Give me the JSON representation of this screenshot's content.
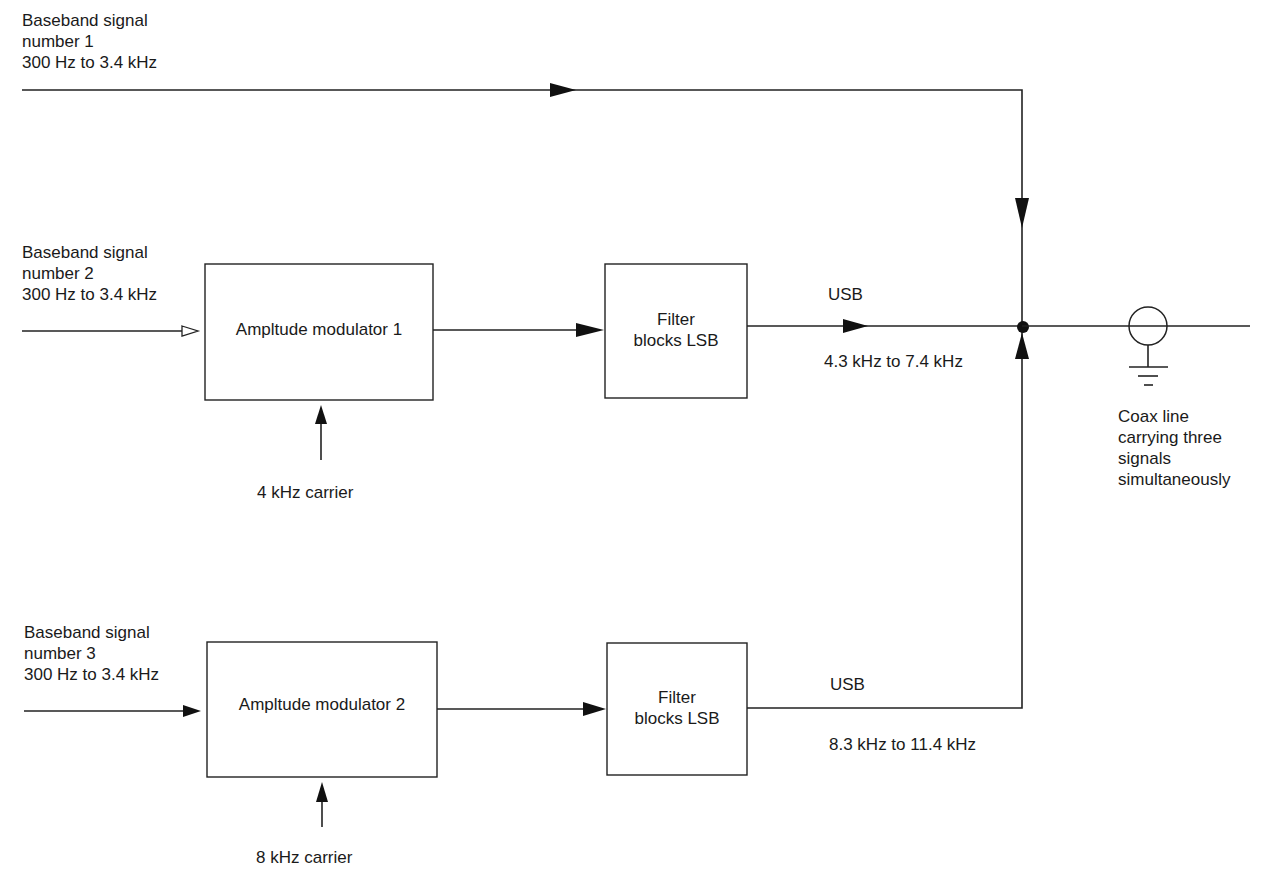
{
  "diagram": {
    "inputs": [
      {
        "line1": "Baseband signal",
        "line2": "number 1",
        "line3": "300 Hz to 3.4 kHz"
      },
      {
        "line1": "Baseband signal",
        "line2": "number 2",
        "line3": "300 Hz to 3.4 kHz"
      },
      {
        "line1": "Baseband signal",
        "line2": "number 3",
        "line3": "300 Hz to 3.4 kHz"
      }
    ],
    "modulators": [
      {
        "label": "Ampltude modulator 1",
        "carrier": "4 kHz carrier"
      },
      {
        "label": "Ampltude modulator 2",
        "carrier": "8 kHz carrier"
      }
    ],
    "filters": [
      {
        "line1": "Filter",
        "line2": "blocks LSB"
      },
      {
        "line1": "Filter",
        "line2": "blocks LSB"
      }
    ],
    "outputs": [
      {
        "sideband": "USB",
        "range": "4.3 kHz to 7.4 kHz"
      },
      {
        "sideband": "USB",
        "range": "8.3 kHz to 11.4 kHz"
      }
    ],
    "coax": {
      "line1": "Coax line",
      "line2": "carrying three",
      "line3": "signals",
      "line4": "simultaneously"
    },
    "colors": {
      "stroke": "#222222",
      "background": "#ffffff",
      "text": "#1a1a1a"
    }
  }
}
